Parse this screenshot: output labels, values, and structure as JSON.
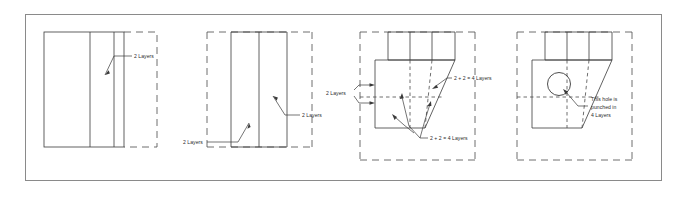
{
  "figure": {
    "frame": {
      "stroke": "#8a8a8a",
      "fill": "#ffffff"
    },
    "line_color": "#3a3a3a",
    "dash_color": "#4a4a4a",
    "text_color": "#2b2b2b"
  },
  "panels": [
    {
      "id": "panel-1",
      "name": "flat-sheet-two-folds",
      "labels": [
        {
          "id": "p1-label-1",
          "text": "2 Layers"
        }
      ]
    },
    {
      "id": "panel-2",
      "name": "folded-sheet-narrow",
      "labels": [
        {
          "id": "p2-label-1",
          "text": "2 Layers"
        },
        {
          "id": "p2-label-2",
          "text": "2 Layers"
        }
      ]
    },
    {
      "id": "panel-3",
      "name": "angled-fold-layer-count",
      "labels": [
        {
          "id": "p3-label-1",
          "text": "2 Layers"
        },
        {
          "id": "p3-label-2",
          "text": "2 + 2 = 4 Layers"
        },
        {
          "id": "p3-label-3",
          "text": "2 + 2 = 4 Layers"
        }
      ]
    },
    {
      "id": "panel-4",
      "name": "punched-hole-result",
      "labels": [
        {
          "id": "p4-label-1",
          "line1": "This hole is",
          "line2": "punched in",
          "line3": "4 Layers"
        }
      ]
    }
  ]
}
